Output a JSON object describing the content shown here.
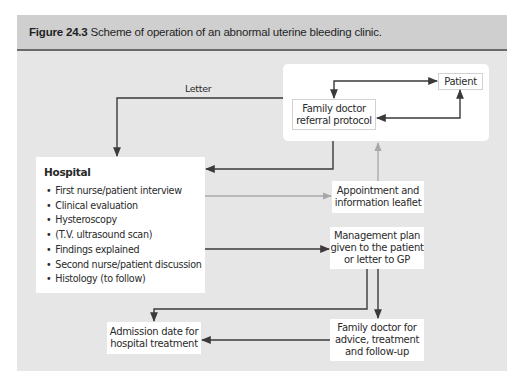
{
  "figure": {
    "number": "Figure 24.3",
    "caption": "Scheme of operation of an abnormal uterine bleeding clinic."
  },
  "nodes": {
    "patient": "Patient",
    "family_doctor_referral": [
      "Family doctor",
      "referral protocol"
    ],
    "hospital": {
      "title": "Hospital",
      "items": [
        "First nurse/patient interview",
        "Clinical evaluation",
        "Hysteroscopy",
        "(T.V. ultrasound scan)",
        "Findings explained",
        "Second nurse/patient discussion",
        "Histology (to follow)"
      ]
    },
    "appointment": [
      "Appointment and",
      "information leaflet"
    ],
    "management": [
      "Management plan",
      "given to the patient",
      "or letter to GP"
    ],
    "admission": [
      "Admission date for",
      "hospital treatment"
    ],
    "family_doctor_followup": [
      "Family doctor for",
      "advice, treatment",
      "and follow-up"
    ]
  },
  "edges": {
    "letter_label": "Letter"
  },
  "colors": {
    "panel_bg": "#e6e6e6",
    "header_bg": "#cfcfcf",
    "header_rule": "#6b6b6b",
    "arrow_dark": "#3a3a3a",
    "arrow_light": "#a8a8a8"
  }
}
